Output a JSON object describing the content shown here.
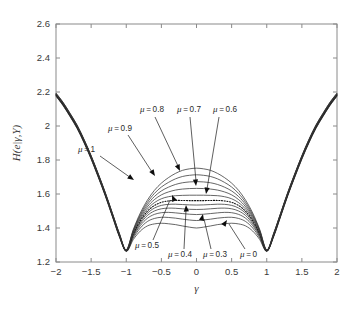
{
  "chart_data": {
    "type": "line",
    "title": "",
    "xlabel": "γ",
    "ylabel": "H(e|γ,Y)",
    "xlim": [
      -2,
      2
    ],
    "ylim": [
      1.2,
      2.6
    ],
    "xticks": [
      "-2",
      "-1.5",
      "-1",
      "-0.5",
      "0",
      "0.5",
      "1",
      "1.5",
      "2"
    ],
    "xtick_values": [
      -2,
      -1.5,
      -1,
      -0.5,
      0,
      0.5,
      1,
      1.5,
      2
    ],
    "yticks": [
      "1.2",
      "1.4",
      "1.6",
      "1.8",
      "2",
      "2.2",
      "2.4",
      "2.6"
    ],
    "ytick_values": [
      1.2,
      1.4,
      1.6,
      1.8,
      2.0,
      2.2,
      2.4,
      2.6
    ],
    "grid": false,
    "legend_position": "none",
    "x": [
      -2,
      -1.9,
      -1.8,
      -1.7,
      -1.6,
      -1.5,
      -1.4,
      -1.3,
      -1.2,
      -1.1,
      -1,
      -0.9,
      -0.8,
      -0.7,
      -0.6,
      -0.5,
      -0.4,
      -0.3,
      -0.2,
      -0.1,
      0,
      0.1,
      0.2,
      0.3,
      0.4,
      0.5,
      0.6,
      0.7,
      0.8,
      0.9,
      1,
      1.1,
      1.2,
      1.3,
      1.4,
      1.5,
      1.6,
      1.7,
      1.8,
      1.9,
      2
    ],
    "series": [
      {
        "name": "μ = 0",
        "style": "solid",
        "values": [
          2.175,
          2.12,
          2.055,
          1.985,
          1.9,
          1.805,
          1.7,
          1.59,
          1.47,
          1.35,
          1.262,
          1.332,
          1.382,
          1.412,
          1.424,
          1.428,
          1.425,
          1.42,
          1.412,
          1.405,
          1.4,
          1.405,
          1.412,
          1.42,
          1.425,
          1.428,
          1.424,
          1.412,
          1.382,
          1.332,
          1.262,
          1.35,
          1.47,
          1.59,
          1.7,
          1.805,
          1.9,
          1.985,
          2.055,
          2.12,
          2.175
        ]
      },
      {
        "name": "μ = 0.1",
        "style": "solid",
        "values": [
          2.177,
          2.122,
          2.057,
          1.988,
          1.903,
          1.808,
          1.703,
          1.593,
          1.473,
          1.353,
          1.263,
          1.342,
          1.4,
          1.438,
          1.456,
          1.463,
          1.462,
          1.458,
          1.452,
          1.447,
          1.444,
          1.447,
          1.452,
          1.458,
          1.462,
          1.463,
          1.456,
          1.438,
          1.4,
          1.342,
          1.263,
          1.353,
          1.473,
          1.593,
          1.703,
          1.808,
          1.903,
          1.988,
          2.057,
          2.122,
          2.177
        ]
      },
      {
        "name": "μ = 0.2",
        "style": "solid",
        "values": [
          2.179,
          2.124,
          2.059,
          1.99,
          1.905,
          1.81,
          1.705,
          1.595,
          1.475,
          1.355,
          1.264,
          1.35,
          1.414,
          1.457,
          1.48,
          1.49,
          1.492,
          1.489,
          1.485,
          1.481,
          1.479,
          1.481,
          1.485,
          1.489,
          1.492,
          1.49,
          1.48,
          1.457,
          1.414,
          1.35,
          1.264,
          1.355,
          1.475,
          1.595,
          1.705,
          1.81,
          1.905,
          1.99,
          2.059,
          2.124,
          2.179
        ]
      },
      {
        "name": "μ = 0.3",
        "style": "solid",
        "values": [
          2.18,
          2.126,
          2.061,
          1.992,
          1.907,
          1.812,
          1.707,
          1.597,
          1.477,
          1.357,
          1.265,
          1.356,
          1.425,
          1.473,
          1.5,
          1.513,
          1.517,
          1.516,
          1.513,
          1.51,
          1.509,
          1.51,
          1.513,
          1.516,
          1.517,
          1.513,
          1.5,
          1.473,
          1.425,
          1.356,
          1.265,
          1.357,
          1.477,
          1.597,
          1.707,
          1.812,
          1.907,
          1.992,
          2.061,
          2.126,
          2.18
        ]
      },
      {
        "name": "μ = 0.4",
        "style": "solid",
        "values": [
          2.182,
          2.128,
          2.063,
          1.994,
          1.909,
          1.814,
          1.709,
          1.599,
          1.479,
          1.359,
          1.266,
          1.361,
          1.434,
          1.486,
          1.517,
          1.533,
          1.539,
          1.54,
          1.538,
          1.536,
          1.535,
          1.536,
          1.538,
          1.54,
          1.539,
          1.533,
          1.517,
          1.486,
          1.434,
          1.361,
          1.266,
          1.359,
          1.479,
          1.599,
          1.709,
          1.814,
          1.909,
          1.994,
          2.063,
          2.128,
          2.182
        ]
      },
      {
        "name": "μ = 0.5",
        "style": "dotted",
        "values": [
          2.184,
          2.13,
          2.065,
          1.996,
          1.911,
          1.816,
          1.711,
          1.601,
          1.481,
          1.361,
          1.267,
          1.366,
          1.443,
          1.498,
          1.532,
          1.551,
          1.559,
          1.562,
          1.562,
          1.561,
          1.561,
          1.561,
          1.562,
          1.562,
          1.559,
          1.551,
          1.532,
          1.498,
          1.443,
          1.366,
          1.267,
          1.361,
          1.481,
          1.601,
          1.711,
          1.816,
          1.911,
          1.996,
          2.065,
          2.13,
          2.184
        ]
      },
      {
        "name": "μ = 0.6",
        "style": "solid",
        "values": [
          2.186,
          2.132,
          2.067,
          1.998,
          1.913,
          1.818,
          1.713,
          1.603,
          1.483,
          1.363,
          1.268,
          1.371,
          1.452,
          1.511,
          1.549,
          1.572,
          1.584,
          1.59,
          1.592,
          1.593,
          1.593,
          1.593,
          1.592,
          1.59,
          1.584,
          1.572,
          1.549,
          1.511,
          1.452,
          1.371,
          1.268,
          1.363,
          1.483,
          1.603,
          1.713,
          1.818,
          1.913,
          1.998,
          2.067,
          2.132,
          2.186
        ]
      },
      {
        "name": "μ = 0.7",
        "style": "solid",
        "values": [
          2.188,
          2.134,
          2.069,
          2.0,
          1.915,
          1.82,
          1.715,
          1.605,
          1.485,
          1.365,
          1.269,
          1.376,
          1.461,
          1.524,
          1.567,
          1.595,
          1.612,
          1.623,
          1.629,
          1.632,
          1.633,
          1.632,
          1.629,
          1.623,
          1.612,
          1.595,
          1.567,
          1.524,
          1.461,
          1.376,
          1.269,
          1.365,
          1.485,
          1.605,
          1.715,
          1.82,
          1.915,
          2.0,
          2.069,
          2.134,
          2.188
        ]
      },
      {
        "name": "μ = 0.8",
        "style": "solid",
        "values": [
          2.19,
          2.136,
          2.071,
          2.002,
          1.917,
          1.822,
          1.717,
          1.607,
          1.487,
          1.367,
          1.27,
          1.381,
          1.47,
          1.537,
          1.585,
          1.618,
          1.64,
          1.656,
          1.666,
          1.671,
          1.673,
          1.671,
          1.666,
          1.656,
          1.64,
          1.618,
          1.585,
          1.537,
          1.47,
          1.381,
          1.27,
          1.367,
          1.487,
          1.607,
          1.717,
          1.822,
          1.917,
          2.002,
          2.071,
          2.136,
          2.19
        ]
      },
      {
        "name": "μ = 0.9",
        "style": "solid",
        "values": [
          2.192,
          2.138,
          2.073,
          2.004,
          1.919,
          1.824,
          1.719,
          1.609,
          1.489,
          1.369,
          1.271,
          1.386,
          1.479,
          1.55,
          1.603,
          1.641,
          1.668,
          1.689,
          1.703,
          1.71,
          1.713,
          1.71,
          1.703,
          1.689,
          1.668,
          1.641,
          1.603,
          1.55,
          1.479,
          1.386,
          1.271,
          1.369,
          1.489,
          1.609,
          1.719,
          1.824,
          1.919,
          2.004,
          2.073,
          2.138,
          2.192
        ]
      },
      {
        "name": "μ = 1",
        "style": "solid",
        "values": [
          2.194,
          2.14,
          2.075,
          2.006,
          1.921,
          1.826,
          1.721,
          1.611,
          1.491,
          1.371,
          1.272,
          1.391,
          1.488,
          1.563,
          1.621,
          1.664,
          1.696,
          1.721,
          1.739,
          1.748,
          1.752,
          1.748,
          1.739,
          1.721,
          1.696,
          1.664,
          1.621,
          1.563,
          1.488,
          1.391,
          1.272,
          1.371,
          1.491,
          1.611,
          1.721,
          1.826,
          1.921,
          2.006,
          2.075,
          2.14,
          2.194
        ]
      }
    ],
    "annotations": [
      {
        "id": "mu-1",
        "text": "μ = 1",
        "mu": 1.0,
        "label_x": 78,
        "label_y": 152,
        "line": "M 100 156 L 131 178",
        "arrow_x": 134,
        "arrow_y": 180,
        "arrow_angle": 35
      },
      {
        "id": "mu-09",
        "text": "μ = 0.9",
        "mu": 0.9,
        "label_x": 108,
        "label_y": 131,
        "line": "M 128 135 L 152 172",
        "arrow_x": 155,
        "arrow_y": 176,
        "arrow_angle": 57
      },
      {
        "id": "mu-08",
        "text": "μ = 0.8",
        "mu": 0.8,
        "label_x": 140,
        "label_y": 112,
        "line": "M 155 117 L 178 166",
        "arrow_x": 180,
        "arrow_y": 171,
        "arrow_angle": 65
      },
      {
        "id": "mu-07",
        "text": "μ = 0.7",
        "mu": 0.7,
        "label_x": 177,
        "label_y": 112,
        "line": "M 190 117 L 196 181",
        "arrow_x": 196,
        "arrow_y": 186,
        "arrow_angle": 85
      },
      {
        "id": "mu-06",
        "text": "μ = 0.6",
        "mu": 0.6,
        "label_x": 213,
        "label_y": 112,
        "line": "M 219 117 L 207 189",
        "arrow_x": 206,
        "arrow_y": 194,
        "arrow_angle": 100
      },
      {
        "id": "mu-05",
        "text": "μ = 0.5",
        "mu": 0.5,
        "label_x": 135,
        "label_y": 248,
        "line": "M 153 240 L 170 200",
        "arrow_x": 172,
        "arrow_y": 195,
        "arrow_angle": -113
      },
      {
        "id": "mu-04",
        "text": "μ = 0.4",
        "mu": 0.4,
        "label_x": 168,
        "label_y": 257,
        "line": "M 184 249 L 186 210",
        "arrow_x": 186,
        "arrow_y": 205,
        "arrow_angle": -93
      },
      {
        "id": "mu-03",
        "text": "μ = 0.3",
        "mu": 0.3,
        "label_x": 203,
        "label_y": 257,
        "line": "M 211 249 L 204 219",
        "arrow_x": 203,
        "arrow_y": 214,
        "arrow_angle": -77
      },
      {
        "id": "mu-00",
        "text": "μ = 0",
        "mu": 0.0,
        "label_x": 240,
        "label_y": 257,
        "line": "M 245 249 L 229 224",
        "arrow_x": 227,
        "arrow_y": 220,
        "arrow_angle": -57
      }
    ]
  },
  "figure": {
    "axes_color": "#8a8a8a",
    "curve_color": "#333333",
    "text_color": "#3a3a3a",
    "background": "#ffffff"
  }
}
